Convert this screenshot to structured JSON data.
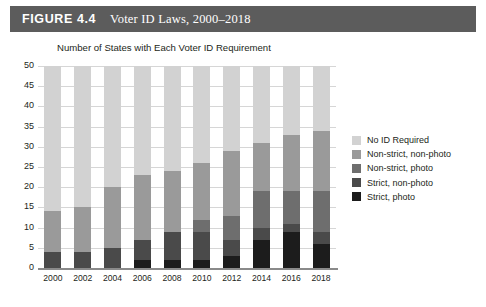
{
  "figure": {
    "label": "FIGURE 4.4",
    "title": "Voter ID Laws, 2000–2018",
    "banner_color": "#5c5c5c"
  },
  "chart_data": {
    "type": "bar",
    "stacked": true,
    "title": "Number of States with Each Voter ID Requirement",
    "subtitle": "",
    "xlabel": "",
    "ylabel": "",
    "ylim": [
      0,
      50
    ],
    "ytick_step": 5,
    "grid": true,
    "legend_position": "right",
    "categories": [
      "2000",
      "2002",
      "2004",
      "2006",
      "2008",
      "2010",
      "2012",
      "2014",
      "2016",
      "2018"
    ],
    "yticks": [
      "0",
      "5",
      "10",
      "15",
      "20",
      "25",
      "30",
      "35",
      "40",
      "45",
      "50"
    ],
    "series": [
      {
        "name": "Strict, photo",
        "color": "#1c1c1c",
        "values": [
          0,
          0,
          0,
          2,
          2,
          2,
          3,
          7,
          9,
          6
        ]
      },
      {
        "name": "Strict, non-photo",
        "color": "#4a4a4a",
        "values": [
          4,
          4,
          5,
          5,
          7,
          7,
          4,
          3,
          2,
          3
        ]
      },
      {
        "name": "Non-strict, photo",
        "color": "#6e6e6e",
        "values": [
          0,
          0,
          0,
          0,
          0,
          3,
          6,
          9,
          8,
          10
        ]
      },
      {
        "name": "Non-strict, non-photo",
        "color": "#9a9a9a",
        "values": [
          10,
          11,
          15,
          16,
          15,
          14,
          16,
          12,
          14,
          15
        ]
      },
      {
        "name": "No ID Required",
        "color": "#d2d2d2",
        "values": [
          36,
          35,
          30,
          27,
          26,
          24,
          21,
          19,
          17,
          16
        ]
      }
    ],
    "legend_order": [
      "No ID Required",
      "Non-strict, non-photo",
      "Non-strict, photo",
      "Strict, non-photo",
      "Strict, photo"
    ]
  }
}
